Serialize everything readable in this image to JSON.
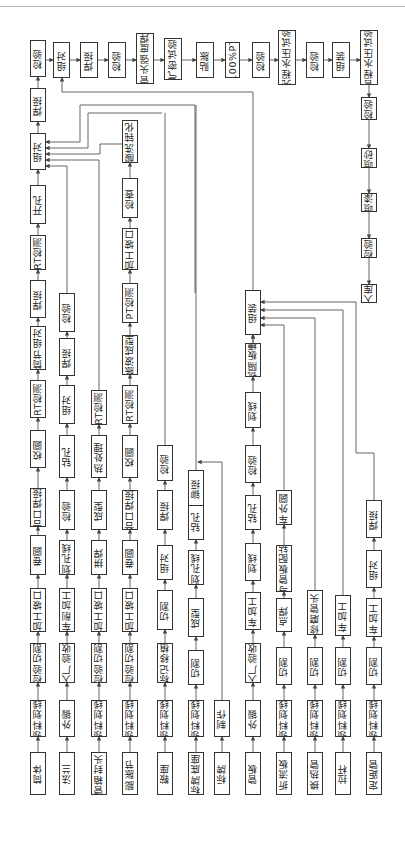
{
  "orientation": "rotated-90-ccw",
  "rows": [
    {
      "start": "筒体",
      "steps": [
        "领料划线",
        "检验切割",
        "加工坡口",
        "卷圆",
        "合口焊接",
        "校圆",
        "RT检测",
        "筒节组对",
        "焊接",
        "RT检测",
        "开孔"
      ]
    },
    {
      "start": "法兰",
      "steps": [
        "外锻",
        "入厂验收",
        "车削加工",
        "划孔线",
        "检验",
        "钻孔",
        "组对",
        "焊接",
        "检验"
      ]
    },
    {
      "start": "管箱封头",
      "steps": [
        "领料划线",
        "检验切割",
        "加工坡口",
        "拼焊",
        "成型",
        "热处理",
        "RT检测"
      ]
    },
    {
      "start": "膨胀节",
      "steps": [
        "领料划线",
        "检验切割",
        "加工坡口",
        "卷圆",
        "合口焊接",
        "校圆",
        "RT检测",
        "胀波成型",
        "PT检测",
        "加工坡口",
        "检查",
        "酸洗钝化"
      ]
    },
    {
      "start": "鞍座",
      "steps": [
        "领料划线",
        "标记移植",
        "切割",
        "组对",
        "焊接",
        "检验"
      ]
    },
    {
      "start": "标牌底座",
      "steps": [
        "领料划线",
        "切割",
        "成型",
        "划孔线",
        "钻孔",
        "铆接"
      ]
    },
    {
      "start": "标牌",
      "steps": [
        "制作"
      ]
    },
    {
      "start": "管板",
      "steps": [
        "外锻",
        "入厂验收",
        "车加工",
        "划线",
        "钻孔",
        "检验",
        "划线",
        "铣隔板槽",
        "组装"
      ]
    },
    {
      "start": "折流板",
      "steps": [
        "领料划线",
        "切割",
        "点焊",
        "与管板配钻",
        "车外圆"
      ]
    },
    {
      "start": "换热管",
      "steps": [
        "领料划线",
        "切割",
        "修磨管头"
      ]
    },
    {
      "start": "拉杆",
      "steps": [
        "领料划线",
        "切割",
        "车加工"
      ]
    },
    {
      "start": "定距管",
      "steps": [
        "领料划线",
        "切割",
        "车加工",
        "组对",
        "焊接"
      ]
    }
  ],
  "main_line": {
    "first": [
      "组对",
      "焊接",
      "检验"
    ],
    "second": [
      "组对",
      "焊接",
      "检验",
      "管头强度焊",
      "气密试验",
      "贴胀",
      "100%PT",
      "检验",
      "壳程水压试验",
      "检验",
      "组装",
      "管程水压试验"
    ],
    "final": [
      "检验",
      "喷砂",
      "喷漆",
      "检验",
      "入库"
    ]
  },
  "colors": {
    "line": "#555555",
    "box_border": "#333333",
    "text": "#222222",
    "background": "#ffffff"
  }
}
